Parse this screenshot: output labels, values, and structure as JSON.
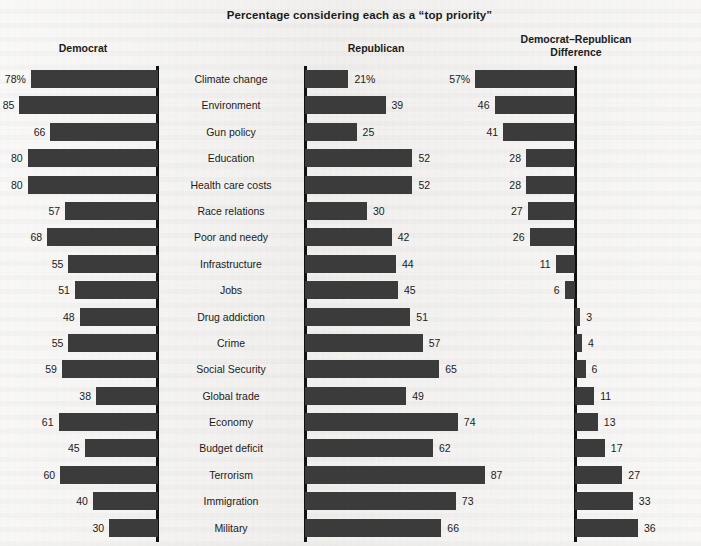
{
  "chart_data": {
    "type": "bar",
    "title": "Percentage considering each as a “top priority”",
    "xlabel": "",
    "ylabel": "",
    "grid": false,
    "legend_position": "none",
    "orientation": "horizontal",
    "panels": [
      {
        "name": "Democrat",
        "header": "Democrat",
        "direction": "left"
      },
      {
        "name": "Republican",
        "header": "Republican",
        "direction": "right"
      },
      {
        "name": "Democrat-Republican Difference",
        "header_line1": "Democrat–Republican",
        "header_line2": "Difference",
        "direction": "diverging"
      }
    ],
    "categories": [
      "Climate change",
      "Environment",
      "Gun policy",
      "Education",
      "Health care costs",
      "Race relations",
      "Poor and needy",
      "Infrastructure",
      "Jobs",
      "Drug addiction",
      "Crime",
      "Social Security",
      "Global trade",
      "Economy",
      "Budget deficit",
      "Terrorism",
      "Immigration",
      "Military"
    ],
    "series": [
      {
        "name": "Democrat",
        "values": [
          78,
          85,
          66,
          80,
          80,
          57,
          68,
          55,
          51,
          48,
          55,
          59,
          38,
          61,
          45,
          60,
          40,
          30
        ],
        "labels": [
          "78%",
          "85",
          "66",
          "80",
          "80",
          "57",
          "68",
          "55",
          "51",
          "48",
          "55",
          "59",
          "38",
          "61",
          "45",
          "60",
          "40",
          "30"
        ]
      },
      {
        "name": "Republican",
        "values": [
          21,
          39,
          25,
          52,
          52,
          30,
          42,
          44,
          45,
          51,
          57,
          65,
          49,
          74,
          62,
          87,
          73,
          66
        ],
        "labels": [
          "21%",
          "39",
          "25",
          "52",
          "52",
          "30",
          "42",
          "44",
          "45",
          "51",
          "57",
          "65",
          "49",
          "74",
          "62",
          "87",
          "73",
          "66"
        ]
      },
      {
        "name": "Democrat-Republican Difference",
        "values": [
          57,
          46,
          41,
          28,
          28,
          27,
          26,
          11,
          6,
          -3,
          -4,
          -6,
          -11,
          -13,
          -17,
          -27,
          -33,
          -36
        ],
        "labels": [
          "57%",
          "46",
          "41",
          "28",
          "28",
          "27",
          "26",
          "11",
          "6",
          "3",
          "4",
          "6",
          "11",
          "13",
          "17",
          "27",
          "33",
          "36"
        ]
      }
    ],
    "axis_max_dem": 92,
    "axis_max_rep": 92,
    "axis_max_diff": 60
  }
}
